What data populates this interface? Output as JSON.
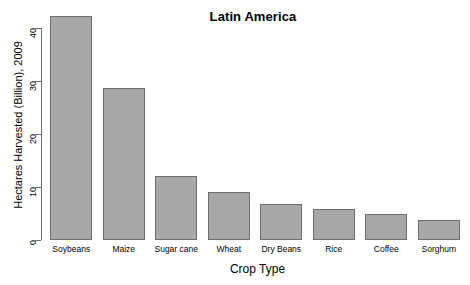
{
  "chart_data": {
    "type": "bar",
    "title": "Latin America",
    "xlabel": "Crop Type",
    "ylabel": "Hectares Harvested (Billion), 2009",
    "categories": [
      "Soybeans",
      "Maize",
      "Sugar cane",
      "Wheat",
      "Dry Beans",
      "Rice",
      "Coffee",
      "Sorghum"
    ],
    "values": [
      42.2,
      28.6,
      12.1,
      9.1,
      6.8,
      5.9,
      4.9,
      3.8
    ],
    "ylim": [
      0,
      43
    ],
    "yticks": [
      0,
      10,
      20,
      30,
      40
    ],
    "ytick_labels": [
      "0",
      "10",
      "20",
      "30",
      "40"
    ],
    "grid": false,
    "legend": false,
    "bar_color": "#a8a8a8",
    "bar_border_color": "#6e6e6e",
    "axis_color": "#6b6b6b",
    "background": "#ffffff"
  }
}
